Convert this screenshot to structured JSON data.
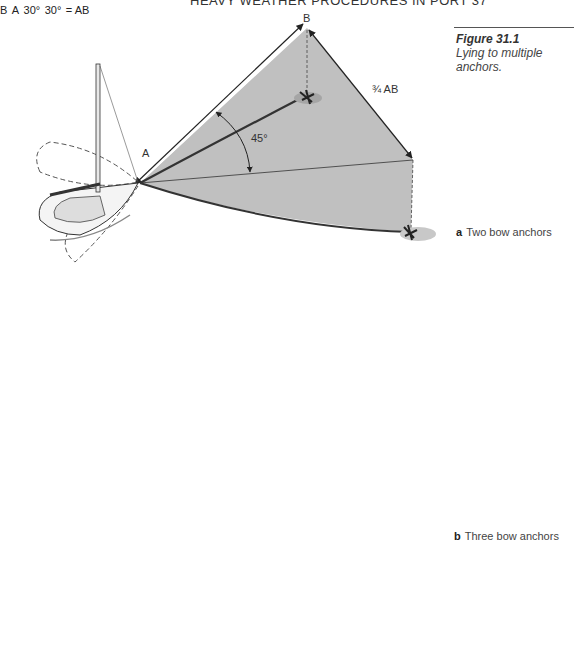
{
  "page": {
    "running_head": "HEAVY WEATHER PROCEDURES IN PORT   37"
  },
  "figure": {
    "number": "Figure 31.1",
    "title": "Lying to multiple anchors.",
    "panels": [
      {
        "letter": "a",
        "caption": "Two bow anchors",
        "labels": {
          "point_a": "A",
          "point_b": "B",
          "angle": "45°",
          "distance": "¾ AB"
        }
      },
      {
        "letter": "b",
        "caption": "Three bow anchors",
        "labels": {
          "point_a": "A",
          "point_b": "B",
          "angle_1": "30°",
          "angle_2": "30°",
          "distance": "= AB"
        }
      }
    ]
  },
  "colors": {
    "sea_shading": "#b9b9b9",
    "sea_shading_light": "#d6d6d6",
    "line": "#333333",
    "bottom_panel": "#a9a9a9"
  }
}
